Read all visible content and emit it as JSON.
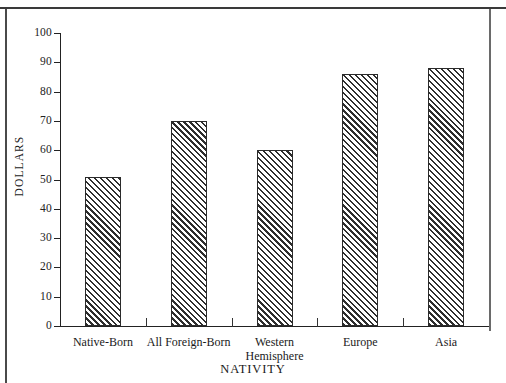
{
  "chart_data": {
    "type": "bar",
    "title": "",
    "subtitle": "",
    "xlabel": "NATIVITY",
    "ylabel": "DOLLARS",
    "categories": [
      "Native-Born",
      "All Foreign-Born",
      "Western Hemisphere",
      "Europe",
      "Asia"
    ],
    "category_lines": [
      [
        "Native-Born"
      ],
      [
        "All Foreign-Born"
      ],
      [
        "Western",
        "Hemisphere"
      ],
      [
        "Europe"
      ],
      [
        "Asia"
      ]
    ],
    "values": [
      51,
      70,
      60,
      86,
      88
    ],
    "ylim": [
      0,
      100
    ],
    "ytick_labels": [
      "100",
      "90",
      "80",
      "70",
      "60",
      "50",
      "40",
      "30",
      "20",
      "10",
      "0"
    ],
    "ytick_values": [
      100,
      90,
      80,
      70,
      60,
      50,
      40,
      30,
      20,
      10,
      0
    ],
    "grid": false,
    "legend": "none",
    "bar_fill": "diagonal-hatch",
    "bar_edge_color": "#2b2b2b",
    "axis_color": "#222222"
  }
}
